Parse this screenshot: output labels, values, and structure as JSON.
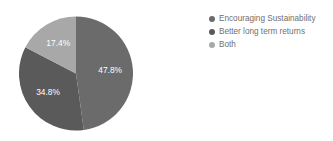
{
  "chart_data": {
    "type": "pie",
    "title": "",
    "subtitle": "",
    "xlabel": "",
    "ylabel": "",
    "grid": false,
    "legend_position": "right",
    "value_unit": "percent",
    "categories": [
      "Encouraging Sustainability",
      "Better long term returns",
      "Both"
    ],
    "values": [
      47.8,
      34.8,
      17.4
    ],
    "data_labels": [
      "47.8%",
      "34.8%",
      "17.4%"
    ],
    "colors": [
      "#6b6b6b",
      "#5a5a5a",
      "#a8a8a8"
    ],
    "slices": [
      {
        "label": "Encouraging Sustainability",
        "value": 47.8,
        "data_label": "47.8%",
        "color": "#6b6b6b",
        "start_angle": 90,
        "end_angle": 262.08,
        "label_x": 35,
        "label_y": 47
      },
      {
        "label": "Better long term returns",
        "value": 34.8,
        "data_label": "34.8%",
        "color": "#5a5a5a",
        "start_angle": 262.08,
        "end_angle": 387.36,
        "label_x": 70,
        "label_y": 97
      },
      {
        "label": "Both",
        "value": 17.4,
        "data_label": "17.4%",
        "color": "#a8a8a8",
        "start_angle": 387.36,
        "end_angle": 450,
        "label_x": 75,
        "label_y": 41
      }
    ]
  },
  "legend": {
    "items": [
      {
        "label": "Encouraging Sustainability",
        "color": "#6b6b6b"
      },
      {
        "label": "Better long term returns",
        "color": "#5a5a5a"
      },
      {
        "label": "Both",
        "color": "#a8a8a8"
      }
    ]
  }
}
